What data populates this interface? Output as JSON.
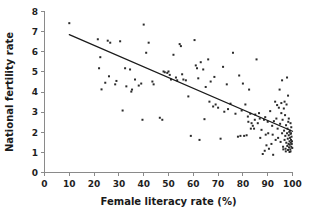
{
  "chart_data": {
    "type": "scatter",
    "title": "",
    "xlabel": "Female literacy rate (%)",
    "ylabel": "National fertility rate",
    "xlim": [
      0,
      100
    ],
    "ylim": [
      0,
      8
    ],
    "xticks": [
      0,
      10,
      20,
      30,
      40,
      50,
      60,
      70,
      80,
      90,
      100
    ],
    "yticks": [
      0,
      1,
      2,
      3,
      4,
      5,
      6,
      7,
      8
    ],
    "grid": false,
    "legend": null,
    "point_color": "#2b2b2b",
    "line_color": "#1a1a1a",
    "axis_color": "#8a8a8a",
    "trendline": {
      "type": "linear",
      "x": [
        10,
        100
      ],
      "y": [
        6.85,
        2.05
      ],
      "slope": -0.0533,
      "intercept": 7.383
    },
    "points": [
      [
        10.0,
        7.42
      ],
      [
        21.5,
        6.62
      ],
      [
        22.0,
        5.18
      ],
      [
        22.5,
        5.73
      ],
      [
        23.0,
        4.13
      ],
      [
        24.5,
        4.46
      ],
      [
        25.5,
        6.55
      ],
      [
        26.0,
        4.78
      ],
      [
        26.5,
        6.45
      ],
      [
        28.5,
        4.38
      ],
      [
        29.0,
        4.55
      ],
      [
        30.5,
        6.52
      ],
      [
        31.5,
        3.08
      ],
      [
        32.5,
        5.18
      ],
      [
        33.0,
        4.28
      ],
      [
        34.5,
        5.12
      ],
      [
        35.0,
        4.02
      ],
      [
        35.3,
        4.12
      ],
      [
        36.5,
        4.62
      ],
      [
        38.0,
        4.32
      ],
      [
        39.0,
        4.42
      ],
      [
        39.5,
        2.62
      ],
      [
        40.0,
        7.35
      ],
      [
        41.0,
        5.95
      ],
      [
        42.0,
        6.45
      ],
      [
        43.5,
        4.52
      ],
      [
        44.0,
        4.38
      ],
      [
        46.5,
        2.72
      ],
      [
        47.5,
        2.62
      ],
      [
        48.0,
        5.02
      ],
      [
        48.5,
        4.98
      ],
      [
        49.5,
        4.95
      ],
      [
        50.0,
        5.02
      ],
      [
        50.5,
        4.85
      ],
      [
        51.0,
        4.62
      ],
      [
        52.0,
        5.85
      ],
      [
        53.0,
        4.72
      ],
      [
        53.5,
        4.58
      ],
      [
        54.5,
        6.38
      ],
      [
        55.0,
        6.28
      ],
      [
        55.5,
        4.88
      ],
      [
        56.0,
        4.62
      ],
      [
        57.0,
        4.58
      ],
      [
        58.0,
        3.78
      ],
      [
        59.0,
        1.82
      ],
      [
        60.5,
        6.58
      ],
      [
        61.0,
        5.32
      ],
      [
        61.5,
        5.18
      ],
      [
        62.0,
        4.68
      ],
      [
        62.5,
        1.62
      ],
      [
        63.0,
        5.48
      ],
      [
        64.0,
        5.12
      ],
      [
        64.5,
        2.65
      ],
      [
        65.0,
        4.25
      ],
      [
        66.0,
        5.62
      ],
      [
        66.5,
        3.52
      ],
      [
        67.0,
        4.52
      ],
      [
        68.0,
        3.28
      ],
      [
        68.5,
        4.75
      ],
      [
        69.0,
        3.38
      ],
      [
        70.0,
        3.22
      ],
      [
        71.0,
        1.68
      ],
      [
        72.0,
        5.25
      ],
      [
        72.5,
        3.02
      ],
      [
        73.5,
        4.38
      ],
      [
        74.0,
        3.15
      ],
      [
        75.0,
        3.42
      ],
      [
        76.0,
        5.95
      ],
      [
        77.0,
        2.92
      ],
      [
        78.0,
        1.78
      ],
      [
        78.5,
        4.82
      ],
      [
        79.0,
        1.82
      ],
      [
        79.5,
        3.08
      ],
      [
        80.0,
        4.42
      ],
      [
        80.5,
        1.82
      ],
      [
        81.0,
        3.38
      ],
      [
        81.5,
        1.85
      ],
      [
        82.0,
        2.78
      ],
      [
        82.5,
        4.12
      ],
      [
        83.0,
        2.92
      ],
      [
        83.5,
        2.45
      ],
      [
        84.0,
        2.32
      ],
      [
        84.5,
        2.18
      ],
      [
        85.0,
        2.88
      ],
      [
        85.5,
        5.62
      ],
      [
        86.0,
        2.45
      ],
      [
        86.5,
        2.95
      ],
      [
        87.0,
        1.72
      ],
      [
        87.5,
        2.12
      ],
      [
        88.0,
        0.92
      ],
      [
        88.5,
        2.62
      ],
      [
        88.8,
        1.08
      ],
      [
        89.0,
        2.75
      ],
      [
        89.5,
        1.35
      ],
      [
        90.0,
        2.52
      ],
      [
        90.5,
        1.18
      ],
      [
        91.0,
        3.05
      ],
      [
        91.5,
        1.42
      ],
      [
        92.0,
        1.88
      ],
      [
        92.2,
        0.88
      ],
      [
        92.5,
        2.55
      ],
      [
        93.0,
        3.52
      ],
      [
        93.2,
        1.62
      ],
      [
        93.5,
        2.68
      ],
      [
        94.0,
        2.18
      ],
      [
        94.2,
        1.72
      ],
      [
        94.5,
        3.22
      ],
      [
        95.0,
        2.42
      ],
      [
        95.2,
        1.52
      ],
      [
        95.5,
        3.45
      ],
      [
        95.8,
        1.95
      ],
      [
        96.0,
        2.62
      ],
      [
        96.2,
        1.28
      ],
      [
        96.5,
        3.18
      ],
      [
        96.6,
        2.08
      ],
      [
        96.8,
        1.62
      ],
      [
        97.0,
        2.85
      ],
      [
        97.1,
        1.82
      ],
      [
        97.2,
        1.18
      ],
      [
        97.4,
        2.35
      ],
      [
        97.5,
        1.48
      ],
      [
        97.6,
        3.38
      ],
      [
        97.8,
        1.95
      ],
      [
        97.9,
        1.32
      ],
      [
        98.0,
        2.18
      ],
      [
        98.1,
        1.68
      ],
      [
        98.2,
        1.12
      ],
      [
        98.3,
        2.52
      ],
      [
        98.4,
        1.42
      ],
      [
        98.5,
        1.85
      ],
      [
        98.6,
        1.25
      ],
      [
        98.7,
        2.02
      ],
      [
        98.8,
        1.55
      ],
      [
        98.9,
        1.38
      ],
      [
        99.0,
        1.72
      ],
      [
        99.1,
        1.15
      ],
      [
        99.2,
        1.92
      ],
      [
        99.3,
        1.48
      ],
      [
        99.4,
        1.62
      ],
      [
        99.5,
        1.28
      ],
      [
        99.6,
        1.78
      ],
      [
        99.7,
        1.42
      ],
      [
        99.8,
        1.55
      ],
      [
        99.9,
        1.22
      ],
      [
        99.5,
        2.25
      ],
      [
        99.2,
        2.45
      ],
      [
        98.5,
        2.68
      ],
      [
        97.8,
        4.72
      ],
      [
        98.2,
        3.82
      ],
      [
        96.8,
        3.52
      ],
      [
        95.5,
        2.95
      ],
      [
        93.8,
        3.35
      ],
      [
        91.8,
        2.32
      ],
      [
        90.2,
        1.95
      ],
      [
        89.2,
        1.88
      ],
      [
        86.8,
        2.68
      ],
      [
        84.8,
        2.62
      ],
      [
        83.2,
        2.18
      ],
      [
        82.2,
        2.52
      ],
      [
        95.8,
        4.58
      ],
      [
        94.8,
        4.12
      ],
      [
        99.0,
        2.08
      ],
      [
        99.4,
        1.95
      ],
      [
        98.8,
        1.02
      ],
      [
        99.2,
        1.05
      ],
      [
        97.3,
        1.05
      ],
      [
        96.3,
        1.15
      ]
    ]
  },
  "axis_titles": {
    "x": "Female literacy rate (%)",
    "y": "National fertility rate"
  }
}
